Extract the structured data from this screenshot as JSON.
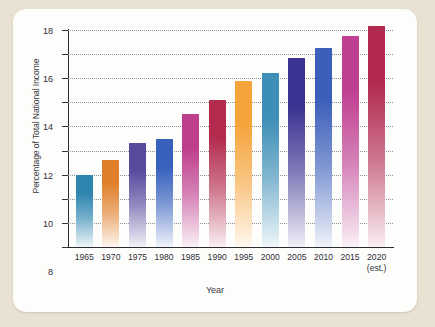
{
  "figure": {
    "background_color": "#e9e1d1",
    "panel_color": "#fdfdfb"
  },
  "chart_data": {
    "type": "bar",
    "title": "",
    "xlabel": "Year",
    "ylabel": "Percentage of Total National Income",
    "categories": [
      "1965",
      "1970",
      "1975",
      "1980",
      "1985",
      "1990",
      "1995",
      "2000",
      "2005",
      "2010",
      "2015",
      "2020"
    ],
    "category_sublabels": [
      "",
      "",
      "",
      "",
      "",
      "",
      "",
      "",
      "",
      "",
      "",
      "(est.)"
    ],
    "values": [
      6.0,
      7.2,
      8.6,
      9.0,
      11.0,
      12.2,
      13.8,
      14.4,
      15.7,
      16.5,
      17.5,
      18.3
    ],
    "ylim": [
      0,
      18
    ],
    "yticks": [
      0,
      2,
      4,
      6,
      8,
      10,
      12,
      14,
      16,
      18
    ],
    "ytick_labels": [
      "0",
      "2",
      "4",
      "6",
      "8",
      "10",
      "12",
      "14",
      "16",
      "18"
    ],
    "grid": true,
    "grid_style": "dotted",
    "legend": "none",
    "bar_colors": [
      "#2e86b0",
      "#e07f2a",
      "#5a4a9e",
      "#3761bd",
      "#bf3f8e",
      "#b32c4e",
      "#f5a43c",
      "#3e8fb6",
      "#3b3391",
      "#3c5fbb",
      "#bf3f91",
      "#b22a50"
    ],
    "bar_gradient": "vertical fade to near-white at base"
  }
}
